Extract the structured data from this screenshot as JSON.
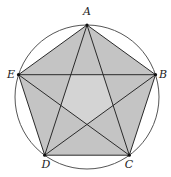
{
  "diagram": {
    "type": "regular-pentagon-inscribed-in-circle-with-diagonals",
    "colors": {
      "background": "#ffffff",
      "circle_stroke": "#555555",
      "outer_fill": "#c4c4c4",
      "inner_fill": "#d4d4d4",
      "edge_stroke": "#2a2a2a",
      "diagonal_stroke": "#2a2a2a",
      "vertex_dot": "#111111",
      "label": "#222222"
    },
    "circle": {
      "cx": 87,
      "cy": 97,
      "r": 72
    },
    "vertices": [
      {
        "id": "A",
        "label": "A",
        "x": 87,
        "y": 25,
        "label_x": 87,
        "label_y": 15
      },
      {
        "id": "B",
        "label": "B",
        "x": 155.5,
        "y": 74.7,
        "label_x": 163,
        "label_y": 78
      },
      {
        "id": "C",
        "label": "C",
        "x": 129.3,
        "y": 155.2,
        "label_x": 129,
        "label_y": 168
      },
      {
        "id": "D",
        "label": "D",
        "x": 44.7,
        "y": 155.2,
        "label_x": 46,
        "label_y": 168
      },
      {
        "id": "E",
        "label": "E",
        "x": 18.5,
        "y": 74.7,
        "label_x": 11,
        "label_y": 78
      }
    ],
    "edges": [
      [
        "A",
        "B"
      ],
      [
        "B",
        "C"
      ],
      [
        "C",
        "D"
      ],
      [
        "D",
        "E"
      ],
      [
        "E",
        "A"
      ]
    ],
    "diagonals": [
      [
        "A",
        "C"
      ],
      [
        "A",
        "D"
      ],
      [
        "B",
        "D"
      ],
      [
        "B",
        "E"
      ],
      [
        "C",
        "E"
      ]
    ]
  }
}
